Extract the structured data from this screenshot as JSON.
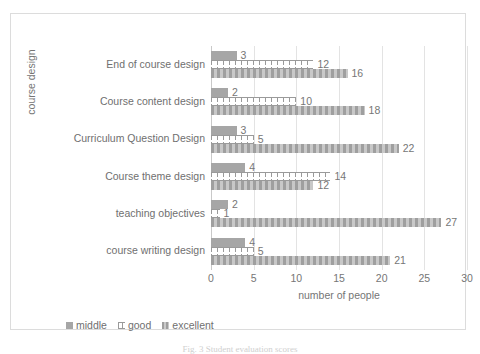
{
  "chart_data": {
    "type": "bar",
    "orientation": "horizontal",
    "title": "",
    "xlabel": "number of people",
    "ylabel": "course design",
    "xlim": [
      0,
      30
    ],
    "xticks": [
      0,
      5,
      10,
      15,
      20,
      25,
      30
    ],
    "grid": true,
    "legend_position": "bottom-left",
    "categories": [
      "course writing design",
      "teaching objectives",
      "Course theme design",
      "Curriculum Question Design",
      "Course content design",
      "End of course design"
    ],
    "series": [
      {
        "name": "middle",
        "values": [
          4,
          2,
          4,
          3,
          2,
          3
        ]
      },
      {
        "name": "good",
        "values": [
          5,
          1,
          14,
          5,
          10,
          12
        ]
      },
      {
        "name": "excellent",
        "values": [
          21,
          27,
          12,
          22,
          18,
          16
        ]
      }
    ]
  },
  "legend": {
    "items": [
      {
        "label": "middle",
        "key": "middle"
      },
      {
        "label": "good",
        "key": "good"
      },
      {
        "label": "excellent",
        "key": "excellent"
      }
    ]
  },
  "caption": {
    "text": "Fig. 3   Student evaluation scores"
  },
  "colors": {
    "middle": "#a6a6a6",
    "good": "#9a9a9a",
    "excellent": "#a8a8a8",
    "gridline": "#e3e3e3",
    "border": "#dcdcdc",
    "text": "#6f6f6f"
  }
}
